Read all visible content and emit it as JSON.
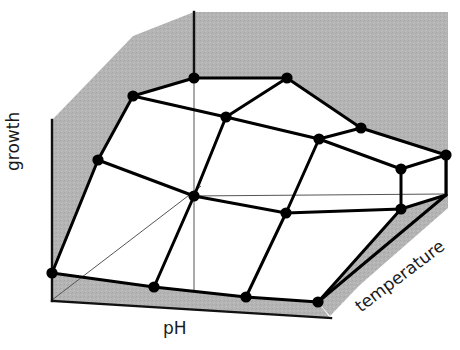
{
  "figure": {
    "title": "",
    "background_color": "#ffffff",
    "width": 460,
    "height": 350
  },
  "labels": {
    "growth": "growth",
    "ph": "pH",
    "temperature": "temperature"
  },
  "style": {
    "shade_color": "#b4b4b4",
    "line_color": "#000000",
    "node_color": "#000000",
    "thin_axis_color": "#555555",
    "text_color": "#1a1a1a",
    "mesh_line_width": 3.0,
    "node_radius": 5.6,
    "thin_line_width": 1.0,
    "axis_line_width": 2.2
  },
  "chart_data": {
    "type": "line",
    "plot_kind": "3d-wireframe-response-surface",
    "title": "",
    "xlabel": "pH",
    "ylabel": "temperature",
    "zlabel": "growth",
    "grid": false,
    "legend": "none",
    "tick_labels": {
      "x": [],
      "y": [],
      "z": []
    },
    "mesh": {
      "rows": 4,
      "cols": 5,
      "row_names": [
        "temp-1",
        "temp-2",
        "temp-3",
        "temp-4"
      ],
      "col_names": [
        "pH-1",
        "pH-2",
        "pH-3",
        "pH-4",
        "pH-5"
      ],
      "nodes_px": [
        [
          [
            194,
            78
          ],
          [
            287,
            78
          ],
          [
            361,
            128
          ],
          [
            446,
            155
          ]
        ],
        [
          [
            133,
            96
          ],
          [
            226,
            117
          ],
          [
            319,
            139
          ],
          [
            401,
            169
          ]
        ],
        [
          [
            98,
            160
          ],
          [
            194,
            196
          ],
          [
            286,
            213
          ],
          [
            401,
            209
          ]
        ],
        [
          [
            52,
            273
          ],
          [
            154,
            287
          ],
          [
            246,
            297
          ],
          [
            318,
            302
          ]
        ]
      ],
      "edges": [
        [
          [
            194,
            78
          ],
          [
            287,
            78
          ]
        ],
        [
          [
            287,
            78
          ],
          [
            361,
            128
          ]
        ],
        [
          [
            361,
            128
          ],
          [
            446,
            155
          ]
        ],
        [
          [
            133,
            96
          ],
          [
            226,
            117
          ]
        ],
        [
          [
            226,
            117
          ],
          [
            319,
            139
          ]
        ],
        [
          [
            319,
            139
          ],
          [
            401,
            169
          ]
        ],
        [
          [
            98,
            160
          ],
          [
            194,
            196
          ]
        ],
        [
          [
            194,
            196
          ],
          [
            286,
            213
          ]
        ],
        [
          [
            286,
            213
          ],
          [
            401,
            209
          ]
        ],
        [
          [
            52,
            273
          ],
          [
            154,
            287
          ]
        ],
        [
          [
            154,
            287
          ],
          [
            246,
            297
          ]
        ],
        [
          [
            246,
            297
          ],
          [
            318,
            302
          ]
        ],
        [
          [
            194,
            78
          ],
          [
            133,
            96
          ]
        ],
        [
          [
            133,
            96
          ],
          [
            98,
            160
          ]
        ],
        [
          [
            98,
            160
          ],
          [
            52,
            273
          ]
        ],
        [
          [
            287,
            78
          ],
          [
            226,
            117
          ]
        ],
        [
          [
            226,
            117
          ],
          [
            194,
            196
          ]
        ],
        [
          [
            194,
            196
          ],
          [
            154,
            287
          ]
        ],
        [
          [
            361,
            128
          ],
          [
            319,
            139
          ]
        ],
        [
          [
            319,
            139
          ],
          [
            286,
            213
          ]
        ],
        [
          [
            286,
            213
          ],
          [
            246,
            297
          ]
        ],
        [
          [
            446,
            155
          ],
          [
            401,
            169
          ]
        ],
        [
          [
            401,
            169
          ],
          [
            401,
            209
          ]
        ],
        [
          [
            401,
            209
          ],
          [
            318,
            302
          ]
        ],
        [
          [
            446,
            155
          ],
          [
            446,
            195
          ]
        ],
        [
          [
            446,
            195
          ],
          [
            401,
            209
          ]
        ],
        [
          [
            446,
            195
          ],
          [
            318,
            302
          ]
        ]
      ],
      "z_values": [
        [
          0.82,
          0.82,
          0.62,
          0.48
        ],
        [
          0.9,
          0.74,
          0.58,
          0.42
        ],
        [
          0.72,
          0.52,
          0.42,
          0.33
        ],
        [
          0.3,
          0.18,
          0.12,
          0.08
        ]
      ]
    },
    "shaded_walls": {
      "back_wall_polygon_px": [
        [
          52,
          120
        ],
        [
          133,
          36
        ],
        [
          194,
          12
        ],
        [
          448,
          12
        ],
        [
          448,
          155
        ],
        [
          446,
          155
        ],
        [
          361,
          128
        ],
        [
          287,
          78
        ],
        [
          194,
          78
        ],
        [
          133,
          96
        ],
        [
          98,
          160
        ],
        [
          52,
          273
        ]
      ],
      "right_wall_polygon_px": [
        [
          446,
          155
        ],
        [
          446,
          195
        ],
        [
          401,
          209
        ],
        [
          318,
          302
        ],
        [
          401,
          209
        ],
        [
          446,
          195
        ]
      ],
      "floor_strip_polygon_px": [
        [
          52,
          300
        ],
        [
          52,
          273
        ],
        [
          154,
          287
        ],
        [
          246,
          297
        ],
        [
          318,
          302
        ],
        [
          446,
          195
        ],
        [
          448,
          208
        ],
        [
          330,
          318
        ]
      ]
    },
    "axes_px": {
      "growth_axis": {
        "x1": 52,
        "y1": 120,
        "x2": 52,
        "y2": 300
      },
      "ph_axis": {
        "x1": 52,
        "y1": 300,
        "x2": 330,
        "y2": 318
      },
      "vertical_guide": {
        "x1": 194,
        "y1": 12,
        "x2": 194,
        "y2": 78
      },
      "thin_vertical_guide": {
        "x1": 194,
        "y1": 78,
        "x2": 194,
        "y2": 290
      },
      "thin_horizontal_guide": {
        "x1": 190,
        "y1": 196,
        "x2": 444,
        "y2": 194
      },
      "thin_diagonal_guide": {
        "x1": 52,
        "y1": 300,
        "x2": 200,
        "y2": 186
      }
    }
  }
}
